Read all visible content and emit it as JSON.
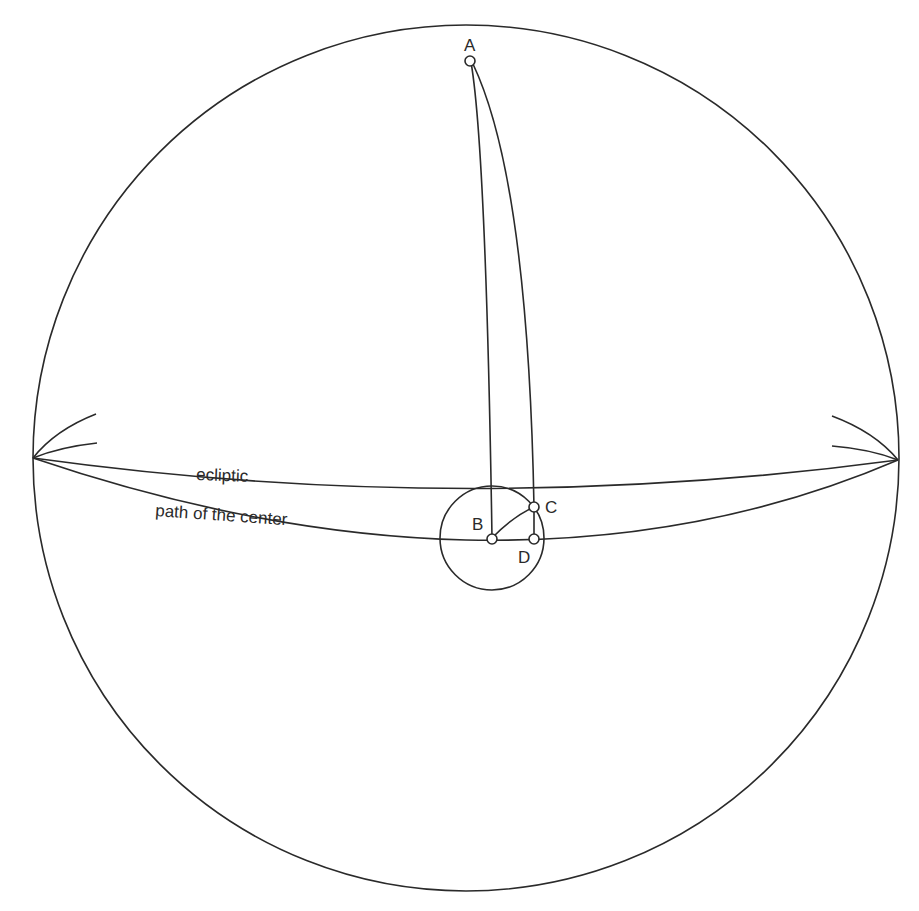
{
  "diagram": {
    "type": "celestial-sphere",
    "curve_labels": {
      "ecliptic": "ecliptic",
      "path": "path of the center"
    },
    "points": [
      {
        "id": "A",
        "label": "A"
      },
      {
        "id": "B",
        "label": "B"
      },
      {
        "id": "C",
        "label": "C"
      },
      {
        "id": "D",
        "label": "D"
      }
    ],
    "colors": {
      "line": "#2a2a2a",
      "background": "#ffffff"
    }
  }
}
